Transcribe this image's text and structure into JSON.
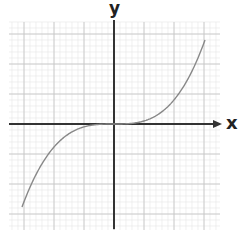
{
  "chart_data": {
    "type": "line",
    "title": "",
    "xlabel": "x",
    "ylabel": "y",
    "xlim": [
      -3,
      3.5
    ],
    "ylim": [
      -3.5,
      3.5
    ],
    "grid": true,
    "legend": null,
    "series": [
      {
        "name": "cubic curve",
        "equation": "y = x^3 (shape)",
        "x": [
          -3,
          -2.5,
          -2,
          -1.5,
          -1,
          -0.5,
          0,
          0.5,
          1,
          1.5,
          2,
          2.5,
          3
        ],
        "y": [
          -2.8,
          -1.9,
          -1.1,
          -0.5,
          -0.15,
          -0.02,
          0,
          0.02,
          0.15,
          0.5,
          1.1,
          1.9,
          2.8
        ]
      }
    ],
    "colors": {
      "curve": "#888888",
      "axes": "#333333",
      "grid_major": "#c8c8c8",
      "grid_minor": "#e6e6e6"
    }
  },
  "labels": {
    "x_axis": "x",
    "y_axis": "y"
  }
}
